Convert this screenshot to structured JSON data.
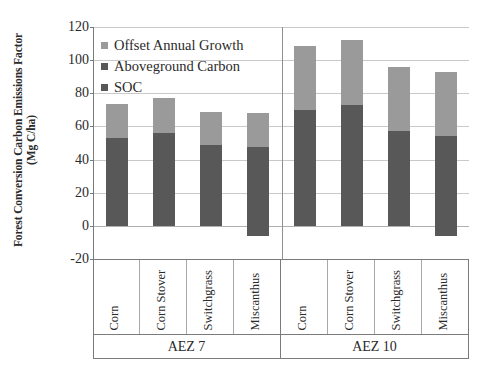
{
  "chart_data": {
    "type": "bar",
    "stacked": true,
    "title": "",
    "xlabel": "",
    "ylabel": "Forest Conversion Carbon Emissions Factor (Mg C/ha)",
    "ylabel_line1": "Forest Conversion Carbon Emissions Factor",
    "ylabel_line2": "(Mg C/ha)",
    "ylim": [
      -20,
      120
    ],
    "yticks": [
      -20,
      0,
      20,
      40,
      60,
      80,
      100,
      120
    ],
    "ytick_labels": [
      "-20",
      "0",
      "20",
      "40",
      "60",
      "80",
      "100",
      "120"
    ],
    "grid": true,
    "legend_position": "upper-left-inside",
    "legend": [
      {
        "label": "Offset Annual Growth",
        "color": "#9a9a9a"
      },
      {
        "label": "Aboveground Carbon",
        "color": "#585858"
      },
      {
        "label": "SOC",
        "color": "#585858"
      }
    ],
    "groups": [
      {
        "name": "AEZ 7",
        "categories": [
          "Corn",
          "Corn Stover",
          "Switchgrass",
          "Miscanthus"
        ]
      },
      {
        "name": "AEZ 10",
        "categories": [
          "Corn",
          "Corn Stover",
          "Switchgrass",
          "Miscanthus"
        ]
      }
    ],
    "categories": [
      "Corn",
      "Corn Stover",
      "Switchgrass",
      "Miscanthus",
      "Corn",
      "Corn Stover",
      "Switchgrass",
      "Miscanthus"
    ],
    "group_of_category": [
      "AEZ 7",
      "AEZ 7",
      "AEZ 7",
      "AEZ 7",
      "AEZ 10",
      "AEZ 10",
      "AEZ 10",
      "AEZ 10"
    ],
    "bars": [
      {
        "group": "AEZ 7",
        "category": "Corn",
        "lower_bottom": 0,
        "lower_top": 53,
        "upper_top": 73.5
      },
      {
        "group": "AEZ 7",
        "category": "Corn Stover",
        "lower_bottom": 0,
        "lower_top": 56,
        "upper_top": 77
      },
      {
        "group": "AEZ 7",
        "category": "Switchgrass",
        "lower_bottom": 0,
        "lower_top": 48.5,
        "upper_top": 69
      },
      {
        "group": "AEZ 7",
        "category": "Miscanthus",
        "lower_bottom": -6,
        "lower_top": 47.5,
        "upper_top": 68
      },
      {
        "group": "AEZ 10",
        "category": "Corn",
        "lower_bottom": 0,
        "lower_top": 70,
        "upper_top": 108.5
      },
      {
        "group": "AEZ 10",
        "category": "Corn Stover",
        "lower_bottom": 0,
        "lower_top": 73,
        "upper_top": 112
      },
      {
        "group": "AEZ 10",
        "category": "Switchgrass",
        "lower_bottom": 0,
        "lower_top": 57,
        "upper_top": 96
      },
      {
        "group": "AEZ 10",
        "category": "Miscanthus",
        "lower_bottom": -6,
        "lower_top": 54,
        "upper_top": 93
      }
    ],
    "series": [
      {
        "name": "SOC + Aboveground Carbon",
        "color": "#585858",
        "values": [
          53,
          56,
          48.5,
          53.5,
          70,
          73,
          57,
          60
        ]
      },
      {
        "name": "Offset Annual Growth",
        "color": "#9a9a9a",
        "values": [
          20.5,
          21,
          20.5,
          20.5,
          38.5,
          39,
          39,
          39
        ]
      }
    ],
    "totals": [
      73.5,
      77,
      69,
      68,
      108.5,
      112,
      96,
      93
    ],
    "colors": {
      "offset_annual_growth": "#9a9a9a",
      "aboveground_carbon": "#585858",
      "soc": "#585858",
      "gridline": "#c9c9c9",
      "axis": "#7b7b7b",
      "text": "#2a2a2a",
      "background": "#ffffff"
    }
  }
}
